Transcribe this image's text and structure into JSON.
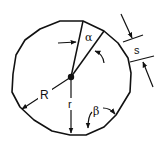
{
  "diagram": {
    "labels": {
      "alpha": "α",
      "beta": "β",
      "R": "R",
      "r": "r",
      "s": "s"
    },
    "colors": {
      "stroke": "#111111",
      "background": "#ffffff"
    }
  }
}
